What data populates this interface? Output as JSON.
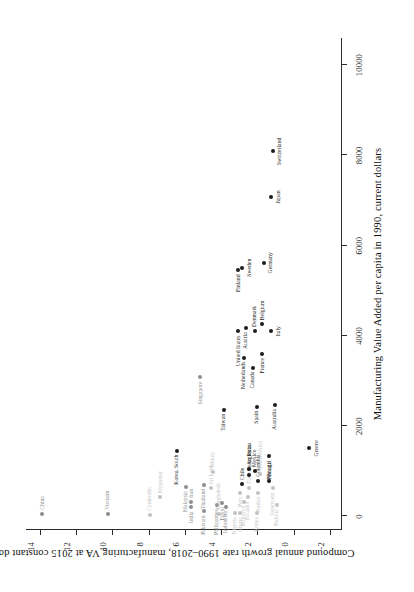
{
  "figure": {
    "rotation_degrees": -90,
    "background": "#ffffff",
    "ink": "#1d1d1d"
  },
  "chart_data": {
    "type": "scatter",
    "title": "",
    "xlabel": "Manufacturing Value Added per capita in 1990, current dollars",
    "ylabel": "Compound annual growth rate 1990–2018, manufacturing VA at 2015 constant dollars",
    "xlim": [
      -300,
      10600
    ],
    "ylim": [
      -2.6,
      14.8
    ],
    "xticks": [
      0,
      2000,
      4000,
      6000,
      8000,
      10000
    ],
    "xticklabels": [
      "0",
      "2000",
      "4000",
      "6000",
      "8000",
      "10000"
    ],
    "yticks": [
      -2,
      0,
      2,
      4,
      6,
      8,
      10,
      12,
      14
    ],
    "yticklabels": [
      "-2",
      "0",
      "2",
      "4",
      "6",
      "8",
      "10",
      "12",
      "14"
    ],
    "grid": false,
    "legend": false,
    "marker_color": "#1d1d1d",
    "points": [
      {
        "label": "China",
        "x": 60,
        "y": 13.9,
        "tone": "mid",
        "pos": "r"
      },
      {
        "label": "Vietnam",
        "x": 60,
        "y": 10.3,
        "tone": "mid",
        "pos": "r"
      },
      {
        "label": "Cambodia",
        "x": 40,
        "y": 8.0,
        "tone": "light",
        "pos": "r"
      },
      {
        "label": "Myanmar",
        "x": 430,
        "y": 7.4,
        "tone": "light",
        "pos": "r"
      },
      {
        "label": "Korea, South",
        "x": 1460,
        "y": 6.5,
        "tone": "dark",
        "pos": "l"
      },
      {
        "label": "Malaysia",
        "x": 650,
        "y": 6.0,
        "tone": "mid",
        "pos": "l"
      },
      {
        "label": "India",
        "x": 200,
        "y": 5.7,
        "tone": "mid",
        "pos": "l"
      },
      {
        "label": "Iran",
        "x": 320,
        "y": 5.7,
        "tone": "mid",
        "pos": "r"
      },
      {
        "label": "Pakistan",
        "x": 110,
        "y": 5.0,
        "tone": "mid",
        "pos": "l"
      },
      {
        "label": "Thailand",
        "x": 700,
        "y": 5.0,
        "tone": "mid",
        "pos": "l"
      },
      {
        "label": "Philippines",
        "x": 250,
        "y": 4.3,
        "tone": "mid",
        "pos": "l"
      },
      {
        "label": "Sri Lanka",
        "x": 620,
        "y": 4.6,
        "tone": "light",
        "pos": "r"
      },
      {
        "label": "Turkey",
        "x": 980,
        "y": 4.5,
        "tone": "light",
        "pos": "r"
      },
      {
        "label": "Bangladesh",
        "x": 60,
        "y": 4.2,
        "tone": "light",
        "pos": "r"
      },
      {
        "label": "Egypt",
        "x": 300,
        "y": 4.0,
        "tone": "mid",
        "pos": "l"
      },
      {
        "label": "Indonesia",
        "x": 210,
        "y": 3.8,
        "tone": "mid",
        "pos": "l"
      },
      {
        "label": "Chile",
        "x": 720,
        "y": 2.9,
        "tone": "dark",
        "pos": "r"
      },
      {
        "label": "Peru",
        "x": 530,
        "y": 3.0,
        "tone": "light",
        "pos": "l"
      },
      {
        "label": "Nigeria",
        "x": 70,
        "y": 3.3,
        "tone": "light",
        "pos": "l"
      },
      {
        "label": "Ghana",
        "x": 70,
        "y": 3.0,
        "tone": "light",
        "pos": "l"
      },
      {
        "label": "Morocco",
        "x": 330,
        "y": 2.8,
        "tone": "light",
        "pos": "l"
      },
      {
        "label": "Ecuador",
        "x": 430,
        "y": 2.6,
        "tone": "light",
        "pos": "l"
      },
      {
        "label": "Tunisia",
        "x": 630,
        "y": 2.5,
        "tone": "light",
        "pos": "r"
      },
      {
        "label": "Argentina",
        "x": 1050,
        "y": 2.5,
        "tone": "dark",
        "pos": "r"
      },
      {
        "label": "Costa Rica",
        "x": 920,
        "y": 2.5,
        "tone": "dark",
        "pos": "r"
      },
      {
        "label": "Mexico",
        "x": 1010,
        "y": 2.2,
        "tone": "dark",
        "pos": "r"
      },
      {
        "label": "Spain",
        "x": 2430,
        "y": 2.1,
        "tone": "dark",
        "pos": "l"
      },
      {
        "label": "Colombia",
        "x": 790,
        "y": 2.0,
        "tone": "dark",
        "pos": "r"
      },
      {
        "label": "South Africa",
        "x": 950,
        "y": 1.9,
        "tone": "light",
        "pos": "r"
      },
      {
        "label": "Kenya",
        "x": 80,
        "y": 2.1,
        "tone": "light",
        "pos": "l"
      },
      {
        "label": "Jordan",
        "x": 520,
        "y": 2.0,
        "tone": "light",
        "pos": "l"
      },
      {
        "label": "Brazil",
        "x": 790,
        "y": 1.4,
        "tone": "dark",
        "pos": "r"
      },
      {
        "label": "Venezuela",
        "x": 620,
        "y": 1.2,
        "tone": "light",
        "pos": "l"
      },
      {
        "label": "Bolivia",
        "x": 250,
        "y": 1.0,
        "tone": "light",
        "pos": "l"
      },
      {
        "label": "Portugal",
        "x": 1330,
        "y": 1.4,
        "tone": "dark",
        "pos": "l"
      },
      {
        "label": "Australia",
        "x": 2470,
        "y": 1.1,
        "tone": "dark",
        "pos": "l"
      },
      {
        "label": "Greece",
        "x": 1510,
        "y": -0.8,
        "tone": "dark",
        "pos": "b"
      },
      {
        "label": "Taiwan",
        "x": 2360,
        "y": 3.9,
        "tone": "dark",
        "pos": "l"
      },
      {
        "label": "Singapore",
        "x": 3080,
        "y": 5.2,
        "tone": "mid",
        "pos": "l"
      },
      {
        "label": "Netherlands",
        "x": 3520,
        "y": 2.8,
        "tone": "dark",
        "pos": "l"
      },
      {
        "label": "Canada",
        "x": 3300,
        "y": 2.3,
        "tone": "dark",
        "pos": "l"
      },
      {
        "label": "France",
        "x": 3600,
        "y": 1.8,
        "tone": "dark",
        "pos": "l"
      },
      {
        "label": "United States",
        "x": 4100,
        "y": 3.1,
        "tone": "dark",
        "pos": "l"
      },
      {
        "label": "Austria",
        "x": 4170,
        "y": 2.7,
        "tone": "dark",
        "pos": "l"
      },
      {
        "label": "Denmark",
        "x": 4110,
        "y": 2.2,
        "tone": "dark",
        "pos": "r"
      },
      {
        "label": "Belgium",
        "x": 4260,
        "y": 1.8,
        "tone": "dark",
        "pos": "r"
      },
      {
        "label": "Italy",
        "x": 4100,
        "y": 1.3,
        "tone": "dark",
        "pos": "b"
      },
      {
        "label": "Finland",
        "x": 5450,
        "y": 3.1,
        "tone": "dark",
        "pos": "l"
      },
      {
        "label": "Sweden",
        "x": 5510,
        "y": 2.9,
        "tone": "dark",
        "pos": "b"
      },
      {
        "label": "Germany",
        "x": 5620,
        "y": 1.7,
        "tone": "dark",
        "pos": "b"
      },
      {
        "label": "Japan",
        "x": 7080,
        "y": 1.3,
        "tone": "dark",
        "pos": "b"
      },
      {
        "label": "Switzerland",
        "x": 8090,
        "y": 1.2,
        "tone": "dark",
        "pos": "b"
      }
    ]
  }
}
